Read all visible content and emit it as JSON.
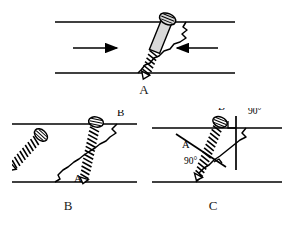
{
  "figure": {
    "background_color": "#ffffff",
    "ink_color": "#000000",
    "screw_fill_color": "#d9d9d9",
    "panels": [
      {
        "id": "A",
        "caption": "A",
        "description": "Lag screw placed across an oblique fracture with interfragmentary compression arrows",
        "cortex_lines": [
          "upper cortex",
          "lower cortex"
        ],
        "fracture_label": "oblique fracture line",
        "arrows": [
          {
            "name": "left-compression-arrow",
            "direction": "right",
            "label": ""
          },
          {
            "name": "right-compression-arrow",
            "direction": "left",
            "label": ""
          }
        ],
        "screws": [
          {
            "name": "lag-screw",
            "type": "lag",
            "head": "slotted",
            "orientation": "tilted"
          }
        ],
        "annotations": []
      },
      {
        "id": "B",
        "caption": "B",
        "description": "Two screw orientations compared: screw A perpendicular to fracture plane and screw B perpendicular to the cortex",
        "cortex_lines": [
          "upper cortex",
          "lower cortex"
        ],
        "fracture_label": "oblique fracture line",
        "arrows": [],
        "screws": [
          {
            "name": "screw-a",
            "type": "fully-threaded",
            "head": "slotted",
            "orientation": "perpendicular-to-fracture"
          },
          {
            "name": "screw-b",
            "type": "fully-threaded",
            "head": "slotted",
            "orientation": "perpendicular-to-cortex"
          }
        ],
        "annotations": [
          {
            "name": "label-a",
            "text": "A",
            "x": 62,
            "y": 72
          },
          {
            "name": "label-b",
            "text": "B",
            "x": 105,
            "y": 6
          }
        ]
      },
      {
        "id": "C",
        "caption": "C",
        "description": "Bisecting screw placement showing the 90 degree angle to the fracture line and the 90 degree angle to the cortex",
        "cortex_lines": [
          "upper cortex",
          "lower cortex"
        ],
        "fracture_label": "oblique fracture line",
        "arrows": [],
        "screws": [
          {
            "name": "bisecting-screw",
            "type": "fully-threaded",
            "head": "slotted",
            "orientation": "bisecting"
          }
        ],
        "annotations": [
          {
            "name": "label-a",
            "text": "A",
            "x": 30,
            "y": 40
          },
          {
            "name": "label-b",
            "text": "B",
            "x": 66,
            "y": 2
          },
          {
            "name": "angle-label-fracture",
            "text": "90°",
            "x": 32,
            "y": 56
          },
          {
            "name": "angle-label-cortex",
            "text": "90°",
            "x": 96,
            "y": 6
          }
        ]
      }
    ]
  }
}
